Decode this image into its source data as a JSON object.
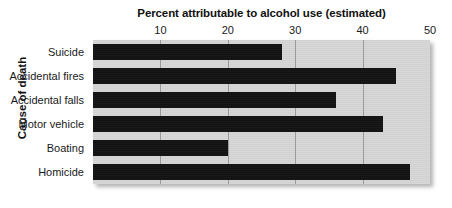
{
  "chart_data": {
    "type": "bar",
    "orientation": "horizontal",
    "title": "Percent attributable to alcohol use (estimated)",
    "xlabel": "Percent attributable to alcohol use (estimated)",
    "ylabel": "Cause of death",
    "categories": [
      "Suicide",
      "Accidental fires",
      "Accidental falls",
      "Motor vehicle",
      "Boating",
      "Homicide"
    ],
    "values": [
      28,
      45,
      36,
      43,
      20,
      47
    ],
    "xlim": [
      0,
      50
    ],
    "xticks": [
      10,
      20,
      30,
      40,
      50
    ],
    "xtick_labels": [
      "10",
      "20",
      "30",
      "40",
      "50"
    ],
    "grid": "vertical",
    "legend": null,
    "bar_color": "#121212",
    "plot_background": "#d6d6d6",
    "gridline_color": "#9b9b9b",
    "figure_background": "#ffffff",
    "axis_position": "top"
  }
}
